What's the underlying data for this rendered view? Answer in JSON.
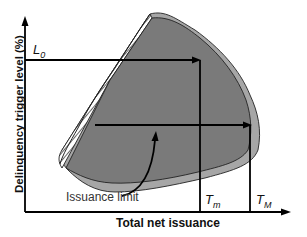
{
  "diagram": {
    "y_axis_label": "Delinquency trigger level (%)",
    "x_axis_label": "Total net issuance",
    "labels": {
      "l0": "L",
      "l0_sub": "0",
      "tm": "T",
      "tm_sub": "m",
      "tM": "T",
      "tM_sub": "M",
      "issuance_limit": "Issuance limit"
    },
    "colors": {
      "inner_region": "#7a7a7a",
      "outer_band": "#a6a6a6",
      "hatch": "#000000",
      "lines": "#000000"
    }
  }
}
